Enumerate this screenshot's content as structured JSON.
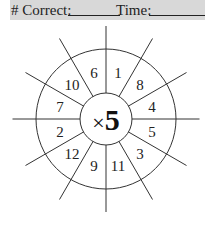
{
  "header": {
    "correct_label": "# Correct:",
    "time_label": "Time:",
    "background": "#d8d8d8"
  },
  "wheel": {
    "operator": "×",
    "multiplier": "5",
    "center_text": "×5",
    "numbers_clockwise_from_top": [
      "1",
      "8",
      "4",
      "5",
      "3",
      "11",
      "9",
      "12",
      "2",
      "7",
      "10",
      "6"
    ],
    "sectors": [
      {
        "label": "1"
      },
      {
        "label": "8"
      },
      {
        "label": "4"
      },
      {
        "label": "5"
      },
      {
        "label": "3"
      },
      {
        "label": "11"
      },
      {
        "label": "9"
      },
      {
        "label": "12"
      },
      {
        "label": "2"
      },
      {
        "label": "7"
      },
      {
        "label": "10"
      },
      {
        "label": "6"
      }
    ],
    "line_color": "#333333"
  }
}
